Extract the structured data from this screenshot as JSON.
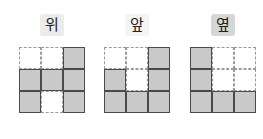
{
  "views": [
    {
      "label": "위",
      "badge_color": "#ececec",
      "cells": [
        [
          0,
          0,
          1
        ],
        [
          1,
          1,
          1
        ],
        [
          1,
          0,
          1
        ]
      ]
    },
    {
      "label": "앞",
      "badge_color": "#f4f4f4",
      "cells": [
        [
          0,
          0,
          1
        ],
        [
          1,
          0,
          1
        ],
        [
          1,
          1,
          1
        ]
      ]
    },
    {
      "label": "옆",
      "badge_color": "#d6d6d6",
      "cells": [
        [
          1,
          0,
          0
        ],
        [
          1,
          0,
          0
        ],
        [
          1,
          1,
          1
        ]
      ]
    }
  ],
  "colors": {
    "filled": "#c9c9c9",
    "border": "#4a4a4a",
    "dashed": "#9a9a9a"
  }
}
